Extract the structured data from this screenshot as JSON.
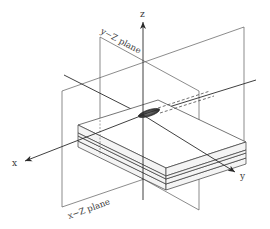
{
  "figure": {
    "type": "3d-coordinate-diagram",
    "axes": {
      "x": {
        "label": "x"
      },
      "y": {
        "label": "y"
      },
      "z": {
        "label": "z"
      }
    },
    "planes": {
      "yz": {
        "label": "y−Z plane"
      },
      "xz": {
        "label": "x−Z plane"
      }
    },
    "object": {
      "name": "layered plate with central crack"
    },
    "colors": {
      "line": "#2a2a2a",
      "plane": "#5a5a5a",
      "crack": "#3c3c3c",
      "background": "#ffffff"
    }
  }
}
